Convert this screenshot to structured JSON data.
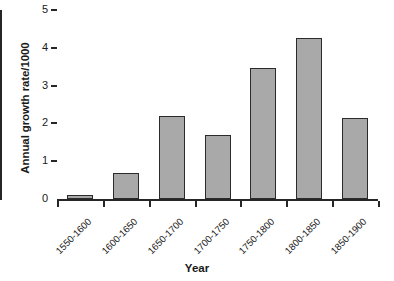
{
  "chart_data": {
    "type": "bar",
    "title": "",
    "xlabel": "Year",
    "ylabel": "Annual growth rate/1000",
    "categories": [
      "1550-1600",
      "1600-1650",
      "1650-1700",
      "1700-1750",
      "1750-1800",
      "1800-1850",
      "1850-1900"
    ],
    "values": [
      0.1,
      0.68,
      2.2,
      1.68,
      3.47,
      4.25,
      2.15
    ],
    "ylim": [
      0,
      5
    ],
    "ytick_labels": [
      "5",
      "4",
      "3",
      "2",
      "1",
      "0"
    ],
    "ytick_values": [
      5,
      4,
      3,
      2,
      1,
      0
    ],
    "grid": false,
    "legend": false,
    "bar_fill_color": "#a9a9a9",
    "bar_border_color": "#2b2b2b",
    "axis_color": "#262626",
    "background_color": "#ffffff"
  }
}
